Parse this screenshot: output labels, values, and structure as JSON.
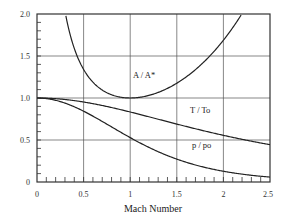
{
  "chart_data": {
    "type": "line",
    "title": "",
    "xlabel": "Mach Number",
    "ylabel": "",
    "xlim": [
      0,
      2.5
    ],
    "ylim": [
      0,
      2.0
    ],
    "grid": true,
    "legend": "inline labels",
    "x_ticks": [
      "0",
      "0.5",
      "1",
      "1.5",
      "2",
      "2.5"
    ],
    "y_ticks": [
      "0",
      "0.5",
      "1.0",
      "1.5",
      "2.0"
    ],
    "x": [
      0,
      0.25,
      0.5,
      0.75,
      1.0,
      1.25,
      1.5,
      1.75,
      2.0,
      2.25,
      2.5
    ],
    "series": [
      {
        "name": "A / A*",
        "label": "A / A*",
        "values": [
          null,
          2.4,
          1.34,
          1.06,
          1.0,
          1.05,
          1.18,
          1.39,
          1.69,
          2.08,
          2.64
        ]
      },
      {
        "name": "T / To",
        "label": "T / To",
        "values": [
          1.0,
          0.99,
          0.95,
          0.9,
          0.83,
          0.76,
          0.69,
          0.62,
          0.56,
          0.5,
          0.44
        ]
      },
      {
        "name": "p / po",
        "label": "p / po",
        "values": [
          1.0,
          0.96,
          0.84,
          0.69,
          0.53,
          0.39,
          0.27,
          0.19,
          0.13,
          0.09,
          0.06
        ]
      }
    ],
    "annotations": [
      {
        "text": "A / A*",
        "x": 1.0,
        "y": 1.3
      },
      {
        "text": "T / To",
        "x": 1.9,
        "y": 0.93
      },
      {
        "text": "p / po",
        "x": 1.95,
        "y": 0.55
      }
    ]
  },
  "labels": {
    "xlabel": "Mach Number",
    "x0": "0",
    "x1": "0.5",
    "x2": "1",
    "x3": "1.5",
    "x4": "2",
    "x5": "2.5",
    "y0": "0",
    "y1": "0.5",
    "y2": "1.0",
    "y3": "1.5",
    "y4": "2.0",
    "area_ratio": "A / A*",
    "temp_ratio": "T / To",
    "press_ratio": "p / po"
  }
}
